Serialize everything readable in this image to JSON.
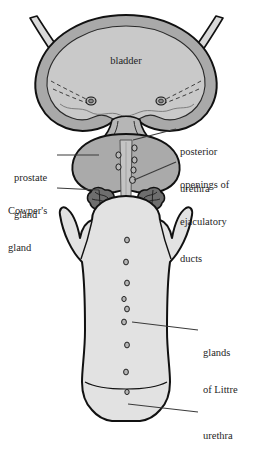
{
  "figure": {
    "inline_labels": [
      {
        "id": "bladder",
        "text": "bladder"
      }
    ],
    "callouts": [
      {
        "id": "prostate-gland",
        "text": "prostate\ngland",
        "side": "left",
        "lines": [
          "prostate",
          "gland"
        ]
      },
      {
        "id": "cowpers-gland",
        "text": "Cowper's\ngland",
        "side": "left",
        "lines": [
          "Cowper's",
          "gland"
        ]
      },
      {
        "id": "posterior-urethra",
        "text": "posterior\nurethra",
        "side": "right",
        "lines": [
          "posterior",
          "urethra"
        ]
      },
      {
        "id": "openings-ejaculatory",
        "text": "openings of\nejaculatory\nducts",
        "side": "right",
        "lines": [
          "openings of",
          "ejaculatory",
          "ducts"
        ]
      },
      {
        "id": "glands-of-littre",
        "text": "glands\nof Littre",
        "side": "right",
        "lines": [
          "glands",
          "of Littre"
        ]
      },
      {
        "id": "urethra",
        "text": "urethra",
        "side": "right",
        "lines": [
          "urethra"
        ]
      }
    ],
    "colors": {
      "background": "#ffffff",
      "outline": "#111111",
      "bladder_wall": "#a9a9a9",
      "bladder_lumen": "#c9c9c9",
      "prostate": "#aaaaaa",
      "shaft": "#e2e2e2",
      "urethra_channel": "#c4c4c4",
      "cowper_gland": "#6e6e6e",
      "leader_line": "#3a3a3a",
      "text": "#1f1f1f"
    },
    "structures": [
      {
        "id": "ureter-left",
        "name": "left ureter"
      },
      {
        "id": "ureter-right",
        "name": "right ureter"
      },
      {
        "id": "bladder",
        "name": "urinary bladder"
      },
      {
        "id": "ureteric-orifice-left",
        "name": "left ureteric orifice"
      },
      {
        "id": "ureteric-orifice-right",
        "name": "right ureteric orifice"
      },
      {
        "id": "prostate",
        "name": "prostate gland"
      },
      {
        "id": "cowper-left",
        "name": "left Cowper's (bulbourethral) gland"
      },
      {
        "id": "cowper-right",
        "name": "right Cowper's (bulbourethral) gland"
      },
      {
        "id": "crus-left",
        "name": "left crus"
      },
      {
        "id": "crus-right",
        "name": "right crus"
      },
      {
        "id": "shaft",
        "name": "penile shaft"
      },
      {
        "id": "glans",
        "name": "glans"
      },
      {
        "id": "urethra",
        "name": "urethra"
      }
    ],
    "counts": {
      "ejaculatory_openings": 6,
      "littre_glands": 9,
      "ureters": 2,
      "cowpers_glands": 2
    }
  }
}
